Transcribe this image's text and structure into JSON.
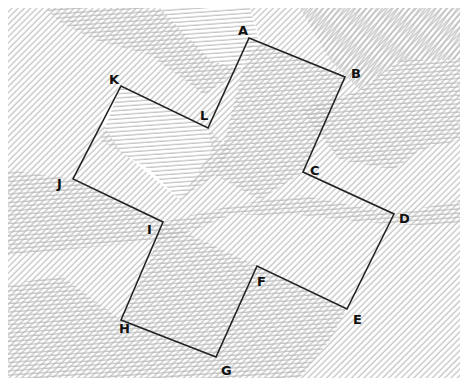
{
  "diagram": {
    "type": "polygon-on-hatched-illusion-background",
    "shape": "cross-shaped 12-gon",
    "stroke_color": "#222222",
    "hatch_color": "#b8b8b8",
    "background_color": "#ffffff",
    "vertices": [
      {
        "id": "A",
        "x": 249,
        "y": 38,
        "label_x": 238,
        "label_y": 35
      },
      {
        "id": "B",
        "x": 345,
        "y": 77,
        "label_x": 351,
        "label_y": 78
      },
      {
        "id": "C",
        "x": 303,
        "y": 172,
        "label_x": 310,
        "label_y": 175
      },
      {
        "id": "D",
        "x": 394,
        "y": 214,
        "label_x": 399,
        "label_y": 223
      },
      {
        "id": "E",
        "x": 347,
        "y": 309,
        "label_x": 353,
        "label_y": 324
      },
      {
        "id": "F",
        "x": 257,
        "y": 266,
        "label_x": 257,
        "label_y": 286
      },
      {
        "id": "G",
        "x": 216,
        "y": 357,
        "label_x": 221,
        "label_y": 375
      },
      {
        "id": "H",
        "x": 121,
        "y": 320,
        "label_x": 119,
        "label_y": 333
      },
      {
        "id": "I",
        "x": 163,
        "y": 222,
        "label_x": 147,
        "label_y": 234
      },
      {
        "id": "J",
        "x": 73,
        "y": 179,
        "label_x": 57,
        "label_y": 188
      },
      {
        "id": "K",
        "x": 121,
        "y": 86,
        "label_x": 109,
        "label_y": 84
      },
      {
        "id": "L",
        "x": 208,
        "y": 128,
        "label_x": 200,
        "label_y": 120
      }
    ]
  }
}
